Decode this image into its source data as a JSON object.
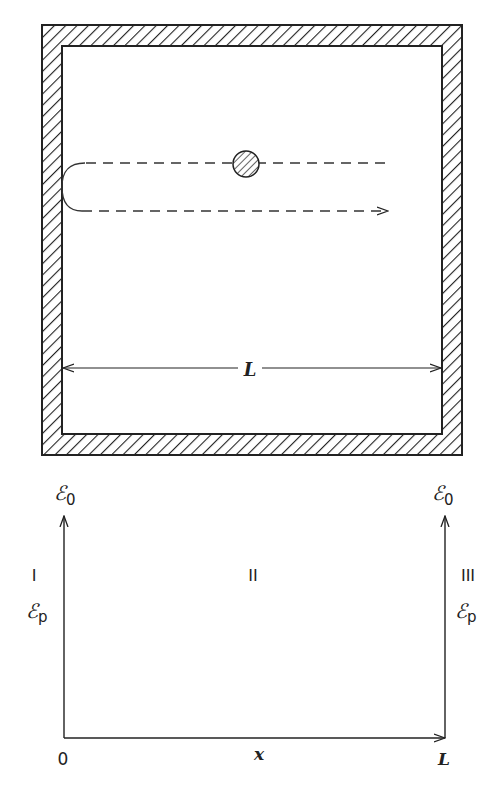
{
  "figure": {
    "top_panel": {
      "name": "box-with-reflecting-particle",
      "dimension_label": "L",
      "colors": {
        "stroke": "#222222",
        "background": "#ffffff"
      }
    },
    "bottom_panel": {
      "name": "potential-well-diagram",
      "regions": [
        "I",
        "II",
        "III"
      ],
      "left_top_label": {
        "main": "ℰ",
        "sub": "0"
      },
      "right_top_label": {
        "main": "ℰ",
        "sub": "0"
      },
      "left_mid_label": {
        "main": "ℰ",
        "sub": "p"
      },
      "right_mid_label": {
        "main": "ℰ",
        "sub": "p"
      },
      "x_axis": {
        "origin": "0",
        "variable": "x",
        "end": "L"
      }
    }
  }
}
